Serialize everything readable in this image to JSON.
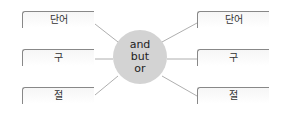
{
  "center": {
    "words": [
      "and",
      "but",
      "or"
    ]
  },
  "left_boxes": [
    {
      "label": "단어"
    },
    {
      "label": "구"
    },
    {
      "label": "절"
    }
  ],
  "right_boxes": [
    {
      "label": "단어"
    },
    {
      "label": "구"
    },
    {
      "label": "절"
    }
  ]
}
